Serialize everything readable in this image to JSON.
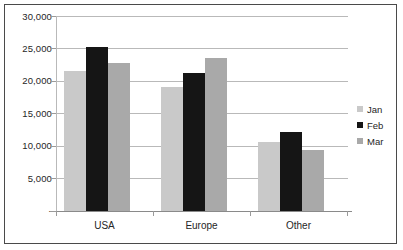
{
  "chart_data": {
    "type": "bar",
    "title": "",
    "subtitle": "",
    "xlabel": "",
    "ylabel": "",
    "categories": [
      "USA",
      "Europe",
      "Other"
    ],
    "series": [
      {
        "name": "Jan",
        "color": "#c9c9c9",
        "values": [
          21500,
          19100,
          10600
        ]
      },
      {
        "name": "Feb",
        "color": "#151515",
        "values": [
          25300,
          21300,
          12200
        ]
      },
      {
        "name": "Mar",
        "color": "#a9a9a9",
        "values": [
          22700,
          23500,
          9400
        ]
      }
    ],
    "ylim": [
      0,
      30000
    ],
    "y_ticks": [
      0,
      5000,
      10000,
      15000,
      20000,
      25000,
      30000
    ],
    "y_tick_labels": [
      "-",
      "5,000",
      "10,000",
      "15,000",
      "20,000",
      "25,000",
      "30,000"
    ],
    "grid": true,
    "legend_position": "right",
    "bar_mode": "grouped",
    "annotations": []
  },
  "legend": {
    "items": [
      {
        "label": "Jan",
        "color": "#c9c9c9"
      },
      {
        "label": "Feb",
        "color": "#151515"
      },
      {
        "label": "Mar",
        "color": "#a9a9a9"
      }
    ]
  },
  "colors": {
    "frame": "#4a4a4a",
    "gridline": "#b9b9b9",
    "axis": "#8a8a8a",
    "text": "#262626",
    "background": "#ffffff"
  }
}
